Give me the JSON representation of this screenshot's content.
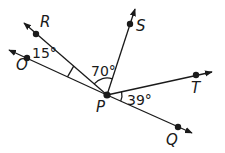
{
  "diagram": {
    "type": "angles-at-point",
    "vertex": {
      "label": "P",
      "x": 107,
      "y": 95
    },
    "rays": [
      {
        "name": "PO",
        "label": "O",
        "point": [
          27,
          58
        ],
        "tip": [
          9,
          50
        ]
      },
      {
        "name": "PR",
        "label": "R",
        "point": [
          36,
          34
        ],
        "tip": [
          24,
          23
        ]
      },
      {
        "name": "PS",
        "label": "S",
        "point": [
          130,
          24
        ],
        "tip": [
          135,
          9
        ]
      },
      {
        "name": "PT",
        "label": "T",
        "point": [
          196,
          75
        ],
        "tip": [
          212,
          72
        ]
      },
      {
        "name": "PQ",
        "label": "Q",
        "point": [
          178,
          127
        ],
        "tip": [
          192,
          133
        ]
      }
    ],
    "angles": [
      {
        "between": [
          "O",
          "R"
        ],
        "value": "15°"
      },
      {
        "between": [
          "R",
          "S"
        ],
        "value": "70°"
      },
      {
        "between": [
          "T",
          "Q"
        ],
        "value": "39°"
      }
    ]
  },
  "labels": {
    "O": "O",
    "R": "R",
    "S": "S",
    "T": "T",
    "Q": "Q",
    "P": "P",
    "angle_ORP": "15°",
    "angle_RPS": "70°",
    "angle_TPQ": "39°"
  },
  "colors": {
    "line": "#1a1a1a",
    "background": "#ffffff"
  }
}
